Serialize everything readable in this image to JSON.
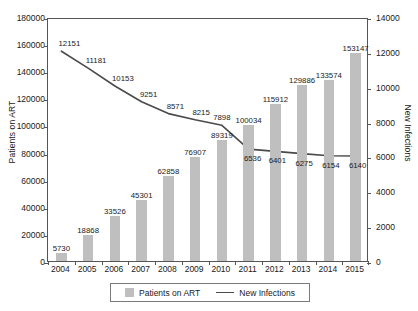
{
  "chart_data": {
    "type": "bar",
    "title": "",
    "subtitle": "",
    "xlabel": "",
    "ylabel": "Patients on ART",
    "y2label": "New Infections",
    "categories": [
      "2004",
      "2005",
      "2006",
      "2007",
      "2008",
      "2009",
      "2010",
      "2011",
      "2012",
      "2013",
      "2014",
      "2015"
    ],
    "series": [
      {
        "name": "Patients on ART",
        "chart_type": "bar",
        "axis": "left",
        "color": "#bfbfbf",
        "values": [
          5730,
          18868,
          33526,
          45301,
          62858,
          76907,
          89319,
          100034,
          115912,
          129886,
          133574,
          153147
        ]
      },
      {
        "name": "New Infections",
        "chart_type": "line",
        "axis": "right",
        "color": "#4a4a4a",
        "values": [
          12151,
          11181,
          10153,
          9251,
          8571,
          8215,
          7898,
          6536,
          6401,
          6275,
          6154,
          6140
        ]
      }
    ],
    "ylim": [
      0,
      180000
    ],
    "y2lim": [
      0,
      14000
    ],
    "yticks": [
      0,
      20000,
      40000,
      60000,
      80000,
      100000,
      120000,
      140000,
      160000,
      180000
    ],
    "y2ticks": [
      0,
      2000,
      4000,
      6000,
      8000,
      10000,
      12000,
      14000
    ],
    "ytick_labels": [
      "0",
      "20000",
      "40000",
      "60000",
      "80000",
      "100000",
      "120000",
      "140000",
      "160000",
      "180000"
    ],
    "y2tick_labels": [
      "0",
      "2000",
      "4000",
      "6000",
      "8000",
      "10000",
      "12000",
      "14000"
    ],
    "grid": false,
    "legend_position": "bottom",
    "legend": [
      "Patients on ART",
      "New Infections"
    ]
  }
}
